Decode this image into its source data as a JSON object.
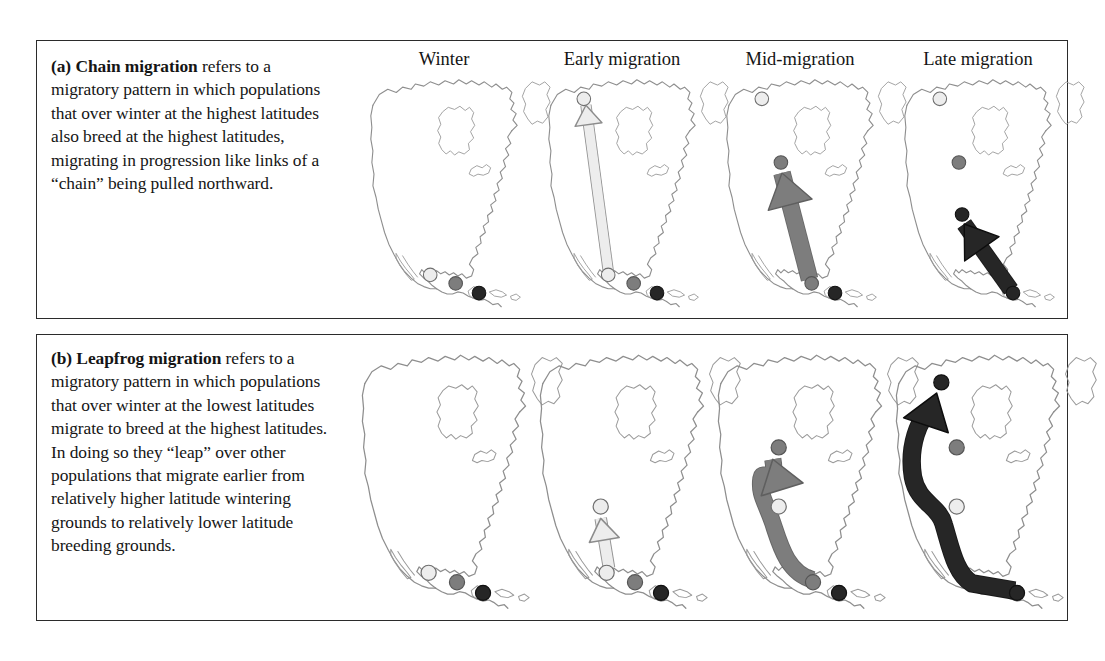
{
  "figure": {
    "background": "#ffffff",
    "border_color": "#2b2b2b"
  },
  "columns": [
    {
      "key": "winter",
      "label": "Winter"
    },
    {
      "key": "early",
      "label": "Early migration"
    },
    {
      "key": "mid",
      "label": "Mid-migration"
    },
    {
      "key": "late",
      "label": "Late migration"
    }
  ],
  "populations": [
    {
      "key": "light",
      "name": "light-population",
      "color": "#ededed",
      "outline": "#6e6e6e"
    },
    {
      "key": "medium",
      "name": "medium-population",
      "color": "#7d7d7d",
      "outline": "#555555"
    },
    {
      "key": "dark",
      "name": "dark-population",
      "color": "#262626",
      "outline": "#111111"
    }
  ],
  "panels": [
    {
      "id": "a",
      "label": "(a)",
      "term": "Chain migration",
      "caption_lead": "(a) Chain migration",
      "caption_rest": " refers to a migratory pattern in which populations that over winter at the highest latitudes also breed at the highest latitudes, migrating in progression like links of a “chain” being pulled northward.",
      "full_caption": "(a) Chain migration refers to a migratory pattern in which populations that over winter at the highest latitudes also breed at the highest latitudes, migrating in progression like links of a “chain” being pulled northward."
    },
    {
      "id": "b",
      "label": "(b)",
      "term": "Leapfrog migration",
      "caption_lead": "(b) Leapfrog migration",
      "caption_rest": " refers to a migratory pattern in which populations that over winter at the lowest latitudes migrate to breed at the highest latitudes. In doing so they “leap” over other populations that migrate earlier from relatively higher latitude wintering grounds to relatively lower latitude breeding grounds.",
      "full_caption": "(b) Leapfrog migration refers to a migratory pattern in which populations that over winter at the lowest latitudes migrate to breed at the highest latitudes. In doing so they “leap” over other populations that migrate earlier from relatively higher latitude wintering grounds to relatively lower latitude breeding grounds."
    }
  ],
  "chart_data": {
    "type": "diagram",
    "rows": [
      {
        "panel": "a",
        "pattern": "chain",
        "stages": [
          {
            "stage": "winter",
            "dots": [
              {
                "pop": "light",
                "x": 62,
                "y": 196
              },
              {
                "pop": "medium",
                "x": 86,
                "y": 204
              },
              {
                "pop": "dark",
                "x": 108,
                "y": 213
              }
            ],
            "arrow": null
          },
          {
            "stage": "early",
            "dots": [
              {
                "pop": "light",
                "x": 39,
                "y": 30
              },
              {
                "pop": "light",
                "x": 62,
                "y": 196
              },
              {
                "pop": "medium",
                "x": 86,
                "y": 204
              },
              {
                "pop": "dark",
                "x": 108,
                "y": 213
              }
            ],
            "arrow": {
              "pop": "light",
              "from": [
                62,
                192
              ],
              "to": [
                41,
                36
              ],
              "width": 9,
              "style": "straight"
            }
          },
          {
            "stage": "mid",
            "dots": [
              {
                "pop": "light",
                "x": 39,
                "y": 30
              },
              {
                "pop": "medium",
                "x": 57,
                "y": 90
              },
              {
                "pop": "medium",
                "x": 86,
                "y": 204
              },
              {
                "pop": "dark",
                "x": 108,
                "y": 213
              }
            ],
            "arrow": {
              "pop": "medium",
              "from": [
                84,
                200
              ],
              "to": [
                58,
                100
              ],
              "width": 15,
              "style": "straight"
            }
          },
          {
            "stage": "late",
            "dots": [
              {
                "pop": "light",
                "x": 39,
                "y": 30
              },
              {
                "pop": "medium",
                "x": 57,
                "y": 90
              },
              {
                "pop": "dark",
                "x": 60,
                "y": 139
              },
              {
                "pop": "dark",
                "x": 108,
                "y": 213
              }
            ],
            "arrow": {
              "pop": "dark",
              "from": [
                106,
                210
              ],
              "to": [
                62,
                148
              ],
              "width": 14,
              "style": "straight"
            }
          }
        ]
      },
      {
        "panel": "b",
        "pattern": "leapfrog",
        "stages": [
          {
            "stage": "winter",
            "dots": [
              {
                "pop": "light",
                "x": 62,
                "y": 196
              },
              {
                "pop": "medium",
                "x": 86,
                "y": 204
              },
              {
                "pop": "dark",
                "x": 108,
                "y": 213
              }
            ],
            "arrow": null
          },
          {
            "stage": "early",
            "dots": [
              {
                "pop": "light",
                "x": 57,
                "y": 140
              },
              {
                "pop": "light",
                "x": 62,
                "y": 196
              },
              {
                "pop": "medium",
                "x": 86,
                "y": 204
              },
              {
                "pop": "dark",
                "x": 108,
                "y": 213
              }
            ],
            "arrow": {
              "pop": "light",
              "from": [
                64,
                192
              ],
              "to": [
                57,
                150
              ],
              "width": 9,
              "style": "straight"
            }
          },
          {
            "stage": "mid",
            "dots": [
              {
                "pop": "medium",
                "x": 57,
                "y": 90
              },
              {
                "pop": "light",
                "x": 57,
                "y": 140
              },
              {
                "pop": "medium",
                "x": 86,
                "y": 204
              },
              {
                "pop": "dark",
                "x": 108,
                "y": 213
              }
            ],
            "arrow": {
              "pop": "medium",
              "from": [
                86,
                202
              ],
              "to": [
                52,
                100
              ],
              "width": 13,
              "style": "curved-leap"
            }
          },
          {
            "stage": "late",
            "dots": [
              {
                "pop": "dark",
                "x": 44,
                "y": 35
              },
              {
                "pop": "medium",
                "x": 57,
                "y": 90
              },
              {
                "pop": "light",
                "x": 57,
                "y": 140
              },
              {
                "pop": "dark",
                "x": 108,
                "y": 213
              }
            ],
            "arrow": {
              "pop": "dark",
              "from": [
                106,
                211
              ],
              "to": [
                40,
                44
              ],
              "width": 14,
              "style": "curved-big-leap"
            }
          }
        ]
      }
    ]
  }
}
